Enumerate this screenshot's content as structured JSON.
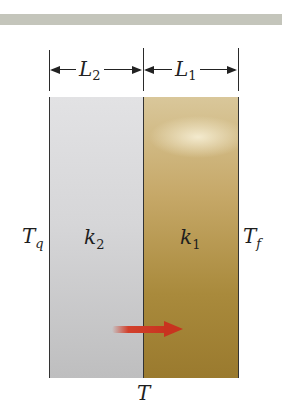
{
  "figure": {
    "type": "composite-slab-heat-conduction",
    "dimensions": {
      "left_length": {
        "symbol": "L",
        "subscript": "2"
      },
      "right_length": {
        "symbol": "L",
        "subscript": "1"
      }
    },
    "materials": [
      {
        "name": "left-slab",
        "symbol": "k",
        "subscript": "2",
        "color": "#d6d6d8"
      },
      {
        "name": "right-slab",
        "symbol": "k",
        "subscript": "1",
        "color": "#b8994f"
      }
    ],
    "temperatures": {
      "left_face": {
        "symbol": "T",
        "subscript": "q"
      },
      "right_face": {
        "symbol": "T",
        "subscript": "f"
      },
      "interface": {
        "symbol": "T"
      }
    },
    "heat_flow": {
      "direction": "left-to-right",
      "color": "#c8331f"
    },
    "colors": {
      "top_band": "#c4c5bb",
      "outline": "#333333"
    }
  }
}
